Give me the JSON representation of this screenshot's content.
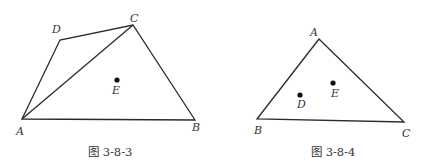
{
  "figures": [
    {
      "caption": "图 3-8-3",
      "labels": {
        "A": "A",
        "B": "B",
        "C": "C",
        "D": "D",
        "E": "E"
      }
    },
    {
      "caption": "图 3-8-4",
      "labels": {
        "A": "A",
        "B": "B",
        "C": "C",
        "D": "D",
        "E": "E"
      }
    }
  ]
}
